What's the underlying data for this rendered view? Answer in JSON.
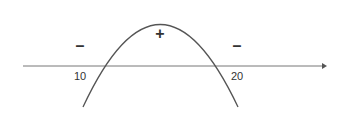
{
  "diagram": {
    "type": "sign-chart-parabola",
    "axis": {
      "x1": 23,
      "x2": 326,
      "y": 66,
      "color": "#777777"
    },
    "curve": {
      "color": "#555555",
      "path": "M83,107 Q160,-58 238,107"
    },
    "roots": [
      {
        "value": "10",
        "x": 80,
        "y": 80
      },
      {
        "value": "20",
        "x": 237,
        "y": 80
      }
    ],
    "signs": [
      {
        "symbol": "–",
        "x": 80,
        "y": 51,
        "region": "left"
      },
      {
        "symbol": "+",
        "x": 160,
        "y": 38,
        "region": "middle"
      },
      {
        "symbol": "–",
        "x": 237,
        "y": 51,
        "region": "right"
      }
    ]
  }
}
